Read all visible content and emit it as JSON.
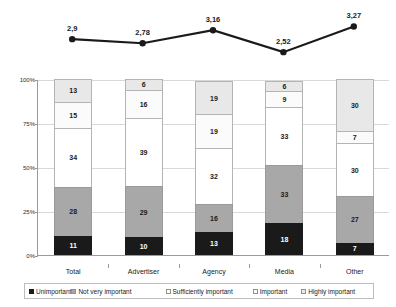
{
  "chart_data": {
    "type": "bar",
    "title": "",
    "subtitle": "",
    "xlabel": "",
    "ylabel": "",
    "ylim": [
      0,
      100
    ],
    "ytick_labels": [
      "0%",
      "25%",
      "50%",
      "75%",
      "100%"
    ],
    "ytick_values": [
      0,
      25,
      50,
      75,
      100
    ],
    "grid": true,
    "stacked": true,
    "legend_position": "bottom",
    "categories": [
      "Total",
      "Advertiser",
      "Agency",
      "Media",
      "Other"
    ],
    "series": [
      {
        "name": "Unimportant",
        "values": [
          11,
          10,
          13,
          18,
          7
        ]
      },
      {
        "name": "Not very important",
        "values": [
          28,
          29,
          16,
          33,
          27
        ]
      },
      {
        "name": "Sufficiently important",
        "values": [
          34,
          39,
          32,
          33,
          30
        ]
      },
      {
        "name": "Important",
        "values": [
          15,
          16,
          19,
          9,
          7
        ]
      },
      {
        "name": "Highly important",
        "values": [
          13,
          6,
          19,
          6,
          30
        ]
      }
    ],
    "overlay_line": {
      "type": "line",
      "name": "Mean score",
      "categories": [
        "Total",
        "Advertiser",
        "Agency",
        "Media",
        "Other"
      ],
      "values": [
        2.9,
        2.78,
        3.16,
        2.52,
        3.27
      ],
      "labels": [
        "2,9",
        "2,78",
        "3,16",
        "2,52",
        "3,27"
      ],
      "marker": "circle",
      "color": "#1a1a1a"
    },
    "colors": {
      "unimportant": "#1a1a1a",
      "not_very_important": "#a8a8a8",
      "sufficiently_important": "#ffffff",
      "important": "#fbfbfb",
      "highly_important": "#e8e8e8",
      "gridline": "#d9d9d9",
      "axis": "#9a9a9a"
    }
  },
  "legend": {
    "items": [
      {
        "label": "Unimportant"
      },
      {
        "label": "Not very important"
      },
      {
        "label": "Sufficiently important"
      },
      {
        "label": "Important"
      },
      {
        "label": "Highly important"
      }
    ]
  }
}
